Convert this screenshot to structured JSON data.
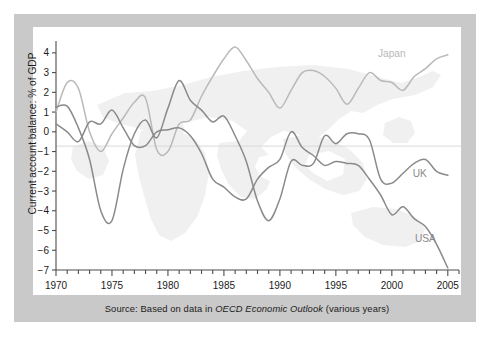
{
  "figure": {
    "source_prefix": "Source: Based on data in ",
    "source_italic": "OECD Economic Outlook",
    "source_suffix": " (various years)",
    "frame_color": "#c9c9c9",
    "panel_color": "#ffffff"
  },
  "chart_data": {
    "type": "line",
    "title": "",
    "xlabel": "",
    "ylabel": "Current account balance: % of GDP",
    "xlim": [
      1970,
      2006
    ],
    "ylim": [
      -7,
      4.6
    ],
    "yticks": [
      4,
      3,
      2,
      1,
      0,
      -1,
      -2,
      -3,
      -4,
      -5,
      -6,
      -7
    ],
    "ytick_labels": [
      "4",
      "3",
      "2",
      "1",
      "0",
      "−1",
      "−2",
      "−3",
      "−4",
      "−5",
      "−6",
      "−7"
    ],
    "xticks": [
      1970,
      1975,
      1980,
      1985,
      1990,
      1995,
      2000,
      2005
    ],
    "xtick_labels": [
      "1970",
      "1975",
      "1980",
      "1985",
      "1990",
      "1995",
      "2000",
      "2005"
    ],
    "xminor_step": 1,
    "grid": false,
    "zero_line": true,
    "legend_position": "inline-labels",
    "background_watermark": "world-map",
    "x": [
      1970,
      1971,
      1972,
      1973,
      1974,
      1975,
      1976,
      1977,
      1978,
      1979,
      1980,
      1981,
      1982,
      1983,
      1984,
      1985,
      1986,
      1987,
      1988,
      1989,
      1990,
      1991,
      1992,
      1993,
      1994,
      1995,
      1996,
      1997,
      1998,
      1999,
      2000,
      2001,
      2002,
      2003,
      2004,
      2005
    ],
    "series": [
      {
        "name": "Japan",
        "color": "#b9b9b9",
        "label_x": 2000,
        "label_y": 3.8,
        "values": [
          1.0,
          2.5,
          2.2,
          0.0,
          -1.0,
          -0.1,
          0.7,
          1.5,
          1.7,
          -0.9,
          -1.0,
          0.4,
          0.6,
          1.8,
          2.8,
          3.7,
          4.3,
          3.6,
          2.7,
          2.0,
          1.2,
          2.1,
          3.0,
          3.1,
          2.8,
          2.2,
          1.4,
          2.2,
          3.0,
          2.6,
          2.5,
          2.1,
          2.8,
          3.2,
          3.7,
          3.9
        ]
      },
      {
        "name": "UK",
        "color": "#8a8a8a",
        "label_x": 2002.5,
        "label_y": -2.3,
        "values": [
          1.25,
          1.3,
          0.2,
          -1.4,
          -4.0,
          -4.5,
          -1.9,
          -0.1,
          0.6,
          -0.3,
          1.2,
          2.6,
          1.6,
          1.1,
          0.5,
          0.8,
          -0.2,
          -1.5,
          -3.5,
          -4.5,
          -3.4,
          -1.5,
          -1.7,
          -1.6,
          -0.2,
          -0.6,
          -0.1,
          -0.1,
          -0.4,
          -2.4,
          -2.6,
          -2.1,
          -1.6,
          -1.4,
          -2.0,
          -2.2
        ]
      },
      {
        "name": "USA",
        "color": "#8a8a8a",
        "label_x": 2003,
        "label_y": -5.6,
        "values": [
          0.4,
          0.0,
          -0.5,
          0.5,
          0.4,
          1.1,
          0.2,
          -0.7,
          -0.7,
          0.0,
          0.1,
          0.2,
          -0.2,
          -1.1,
          -2.4,
          -2.8,
          -3.3,
          -3.4,
          -2.4,
          -1.8,
          -1.4,
          0.0,
          -0.8,
          -1.2,
          -1.7,
          -1.5,
          -1.6,
          -1.7,
          -2.4,
          -3.2,
          -4.2,
          -3.8,
          -4.4,
          -4.8,
          -5.7,
          -6.9
        ]
      }
    ]
  }
}
